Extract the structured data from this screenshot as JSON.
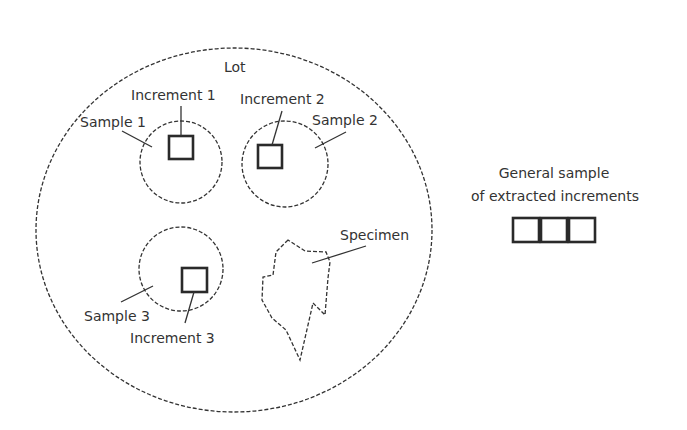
{
  "diagram": {
    "lot_label": "Lot",
    "samples": [
      {
        "label": "Sample 1",
        "increment": "Increment 1"
      },
      {
        "label": "Sample 2",
        "increment": "Increment 2"
      },
      {
        "label": "Sample 3",
        "increment": "Increment 3"
      }
    ],
    "specimen_label": "Specimen",
    "general_sample": {
      "line1": "General sample",
      "line2": "of extracted increments",
      "box_count": 3
    }
  }
}
